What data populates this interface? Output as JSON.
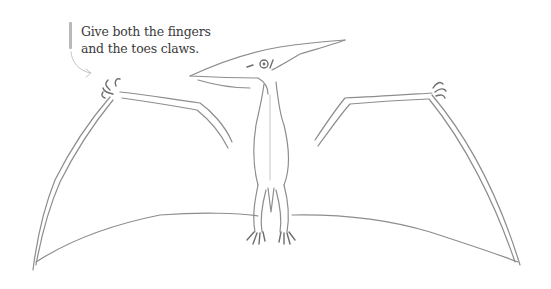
{
  "annotation": {
    "lines": [
      "Give both the fingers",
      "and the toes claws."
    ]
  },
  "illustration": {
    "subject": "pterodactyl-sketch",
    "style": "pencil-drawing"
  },
  "colors": {
    "background": "#ffffff",
    "text": "#3a3a3a",
    "pencil": "#8d8d8d",
    "caption_bar": "#b9b9b9"
  }
}
